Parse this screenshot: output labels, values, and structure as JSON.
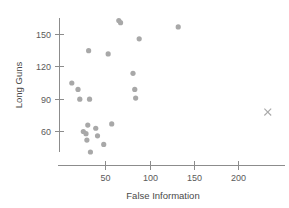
{
  "chart_data": {
    "type": "scatter",
    "title": "",
    "xlabel": "False Information",
    "ylabel": "Long Guns",
    "xlim": [
      0,
      230
    ],
    "ylim": [
      30,
      175
    ],
    "xticks": [
      50,
      100,
      150,
      200
    ],
    "yticks": [
      60,
      90,
      120,
      150
    ],
    "grid": false,
    "legend": null,
    "series": [
      {
        "name": "observations",
        "marker": "filled-circle",
        "color": "#a8a8a8",
        "points": [
          {
            "x": 12,
            "y": 105
          },
          {
            "x": 19,
            "y": 99
          },
          {
            "x": 21,
            "y": 90
          },
          {
            "x": 25,
            "y": 60
          },
          {
            "x": 28,
            "y": 58
          },
          {
            "x": 29,
            "y": 52
          },
          {
            "x": 30,
            "y": 66
          },
          {
            "x": 31,
            "y": 135
          },
          {
            "x": 32,
            "y": 90
          },
          {
            "x": 33,
            "y": 41
          },
          {
            "x": 39,
            "y": 63
          },
          {
            "x": 41,
            "y": 56
          },
          {
            "x": 48,
            "y": 48
          },
          {
            "x": 53,
            "y": 132
          },
          {
            "x": 57,
            "y": 67
          },
          {
            "x": 65,
            "y": 163
          },
          {
            "x": 67,
            "y": 161
          },
          {
            "x": 81,
            "y": 114
          },
          {
            "x": 83,
            "y": 99
          },
          {
            "x": 84,
            "y": 91
          },
          {
            "x": 88,
            "y": 146
          },
          {
            "x": 132,
            "y": 157
          }
        ]
      },
      {
        "name": "outlier",
        "marker": "x-cross",
        "color": "#a8a8a8",
        "points": [
          {
            "x": 233,
            "y": 78
          }
        ]
      }
    ]
  },
  "axes": {
    "x": {
      "title": "False Information",
      "tick_labels": [
        "50",
        "100",
        "150",
        "200"
      ]
    },
    "y": {
      "title": "Long Guns",
      "tick_labels": [
        "60",
        "90",
        "120",
        "150"
      ]
    }
  }
}
